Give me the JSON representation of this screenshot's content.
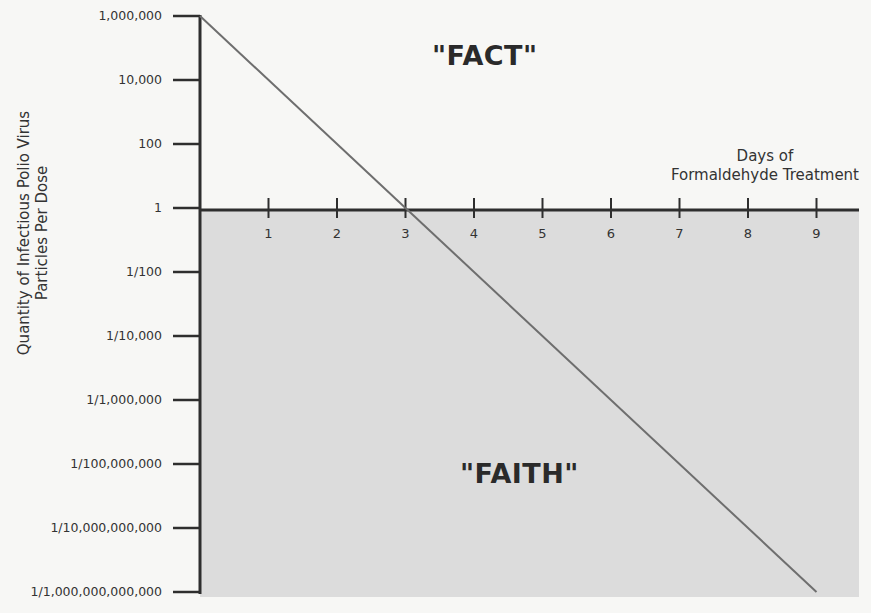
{
  "chart_data": {
    "type": "line",
    "title": "",
    "xlabel": "Days of Formaldehyde Treatment",
    "ylabel": "Quantity of Infectious Polio Virus Particles Per Dose",
    "ylabel_lines": [
      "Quantity of Infectious Polio Virus",
      "Particles Per Dose"
    ],
    "xlabel_lines": [
      "Days of",
      "Formaldehyde Treatment"
    ],
    "y_scale": "log",
    "y_ticks": [
      "1,000,000",
      "10,000",
      "100",
      "1",
      "1/100",
      "1/10,000",
      "1/1,000,000",
      "1/100,000,000",
      "1/10,000,000,000",
      "1/1,000,000,000,000"
    ],
    "y_tick_exponents": [
      6,
      4,
      2,
      0,
      -2,
      -4,
      -6,
      -8,
      -10,
      -12
    ],
    "x_ticks": [
      "1",
      "2",
      "3",
      "4",
      "5",
      "6",
      "7",
      "8",
      "9"
    ],
    "series": [
      {
        "name": "Infectious particles per dose",
        "x": [
          0,
          3,
          9
        ],
        "log10_y": [
          6,
          0,
          -12
        ]
      }
    ],
    "regions": [
      {
        "label": "\"FACT\"",
        "description": "above 1 particle per dose",
        "fill": "#f7f7f5"
      },
      {
        "label": "\"FAITH\"",
        "description": "below 1 particle per dose",
        "fill": "#dcdcdc"
      }
    ],
    "xlim": [
      0,
      9.7
    ],
    "ylim_log10": [
      -12,
      6
    ],
    "grid": false,
    "legend": "none"
  },
  "annotations": {
    "fact": "\"FACT\"",
    "faith": "\"FAITH\""
  },
  "colors": {
    "background": "#f7f7f5",
    "shaded_region": "#dcdcdc",
    "axis": "#2e2e2e",
    "line": "#6e6e6e"
  }
}
